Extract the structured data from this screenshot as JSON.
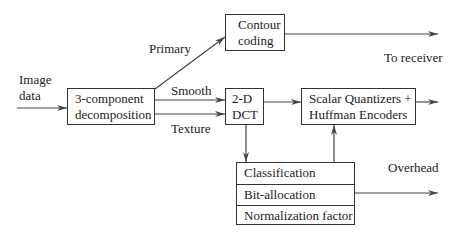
{
  "diagram": {
    "input_label": [
      "Image",
      "data"
    ],
    "blocks": {
      "decomposition": [
        "3-component",
        "decomposition"
      ],
      "contour": [
        "Contour",
        "coding"
      ],
      "dct": [
        "2-D",
        "DCT"
      ],
      "quantizers": [
        "Scalar Quantizers +",
        "Huffman Encoders"
      ],
      "side_info": [
        "Classification",
        "Bit-allocation",
        "Normalization factor"
      ]
    },
    "edge_labels": {
      "primary": "Primary",
      "smooth": "Smooth",
      "texture": "Texture",
      "to_receiver": "To receiver",
      "overhead": "Overhead"
    },
    "edges": [
      {
        "from": "input",
        "to": "decomposition"
      },
      {
        "from": "decomposition",
        "to": "contour",
        "label": "Primary"
      },
      {
        "from": "decomposition",
        "to": "dct",
        "label": "Smooth"
      },
      {
        "from": "decomposition",
        "to": "dct",
        "label": "Texture"
      },
      {
        "from": "contour",
        "to": "output",
        "label": "To receiver"
      },
      {
        "from": "dct",
        "to": "quantizers"
      },
      {
        "from": "dct",
        "to": "side_info"
      },
      {
        "from": "side_info",
        "to": "quantizers"
      },
      {
        "from": "quantizers",
        "to": "output"
      },
      {
        "from": "side_info",
        "to": "output",
        "label": "Overhead"
      }
    ]
  }
}
